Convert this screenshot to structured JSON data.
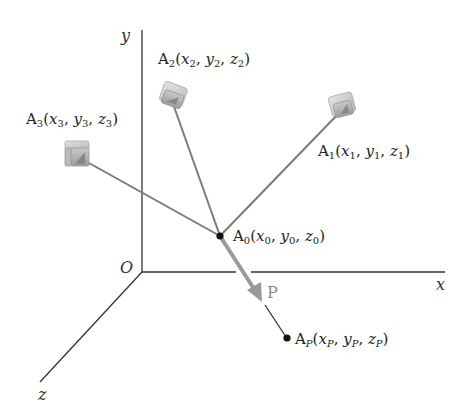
{
  "diagram": {
    "axes": {
      "x_label": "x",
      "y_label": "y",
      "z_label": "z",
      "origin_label": "O"
    },
    "points": {
      "A0": {
        "name": "A",
        "sub": "0",
        "coords": [
          "x",
          "0",
          "y",
          "0",
          "z",
          "0"
        ]
      },
      "A1": {
        "name": "A",
        "sub": "1",
        "coords": [
          "x",
          "1",
          "y",
          "1",
          "z",
          "1"
        ]
      },
      "A2": {
        "name": "A",
        "sub": "2",
        "coords": [
          "x",
          "2",
          "y",
          "2",
          "z",
          "2"
        ]
      },
      "A3": {
        "name": "A",
        "sub": "3",
        "coords": [
          "x",
          "3",
          "y",
          "3",
          "z",
          "3"
        ]
      },
      "AP": {
        "name": "A",
        "sub": "P",
        "coords": [
          "x",
          "P",
          "y",
          "P",
          "z",
          "P"
        ]
      }
    },
    "vector_label": "P",
    "colors": {
      "axis": "#333333",
      "ray": "#7a7a7a",
      "vector": "#9a9a9a",
      "point": "#111111"
    }
  }
}
